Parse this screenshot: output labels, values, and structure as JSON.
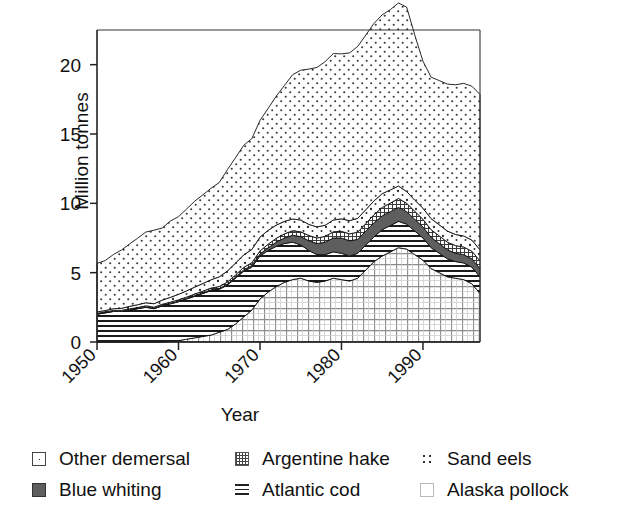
{
  "chart_data": {
    "type": "area",
    "title": "",
    "subtitle": "",
    "xlabel": "Year",
    "ylabel": "Million tonnes",
    "xlim": [
      1950,
      1997
    ],
    "ylim": [
      0,
      22.5
    ],
    "yticks": [
      0,
      5,
      10,
      15,
      20
    ],
    "xticks": [
      1950,
      1960,
      1970,
      1980,
      1990
    ],
    "xticklabels": [
      "1950",
      "1960",
      "1970",
      "1980",
      "1990"
    ],
    "yticklabels": [
      "0",
      "5",
      "10",
      "15",
      "20"
    ],
    "grid": false,
    "stacked": true,
    "legend_position": "below",
    "x": [
      1950,
      1951,
      1952,
      1953,
      1954,
      1955,
      1956,
      1957,
      1958,
      1959,
      1960,
      1961,
      1962,
      1963,
      1964,
      1965,
      1966,
      1967,
      1968,
      1969,
      1970,
      1971,
      1972,
      1973,
      1974,
      1975,
      1976,
      1977,
      1978,
      1979,
      1980,
      1981,
      1982,
      1983,
      1984,
      1985,
      1986,
      1987,
      1988,
      1989,
      1990,
      1991,
      1992,
      1993,
      1994,
      1995,
      1996,
      1997
    ],
    "series": [
      {
        "name": "Alaska pollock",
        "pattern": "grid-light",
        "values": [
          0.0,
          0.0,
          0.0,
          0.0,
          0.0,
          0.0,
          0.0,
          0.0,
          0.0,
          0.05,
          0.1,
          0.2,
          0.3,
          0.4,
          0.5,
          0.7,
          0.9,
          1.3,
          1.8,
          2.3,
          3.1,
          3.6,
          4.0,
          4.3,
          4.5,
          4.6,
          4.4,
          4.3,
          4.4,
          4.6,
          4.5,
          4.4,
          4.6,
          5.2,
          5.8,
          6.2,
          6.5,
          6.8,
          6.7,
          6.3,
          5.9,
          5.3,
          5.0,
          4.7,
          4.6,
          4.5,
          4.2,
          3.5
        ]
      },
      {
        "name": "Atlantic cod",
        "pattern": "horizontal-lines",
        "values": [
          2.0,
          2.1,
          2.2,
          2.2,
          2.3,
          2.4,
          2.5,
          2.4,
          2.6,
          2.7,
          2.8,
          2.9,
          3.0,
          3.1,
          3.2,
          3.1,
          3.2,
          3.3,
          3.3,
          3.1,
          3.1,
          3.0,
          2.9,
          2.8,
          2.7,
          2.4,
          2.2,
          2.0,
          1.9,
          1.9,
          1.9,
          1.8,
          1.8,
          1.8,
          1.8,
          1.9,
          1.9,
          1.9,
          1.8,
          1.7,
          1.6,
          1.5,
          1.4,
          1.3,
          1.2,
          1.2,
          1.2,
          1.2
        ]
      },
      {
        "name": "Blue whiting",
        "pattern": "dark-solid",
        "values": [
          0.02,
          0.02,
          0.02,
          0.02,
          0.02,
          0.02,
          0.03,
          0.03,
          0.03,
          0.03,
          0.04,
          0.04,
          0.05,
          0.05,
          0.06,
          0.06,
          0.07,
          0.08,
          0.1,
          0.12,
          0.15,
          0.2,
          0.3,
          0.4,
          0.5,
          0.6,
          0.7,
          0.8,
          0.9,
          1.0,
          1.1,
          1.1,
          1.0,
          1.0,
          1.0,
          1.0,
          1.0,
          1.0,
          0.9,
          0.85,
          0.8,
          0.75,
          0.7,
          0.65,
          0.6,
          0.6,
          0.6,
          0.6
        ]
      },
      {
        "name": "Argentine hake",
        "pattern": "checkered",
        "values": [
          0.05,
          0.05,
          0.06,
          0.06,
          0.07,
          0.07,
          0.08,
          0.08,
          0.09,
          0.09,
          0.1,
          0.1,
          0.11,
          0.12,
          0.13,
          0.14,
          0.15,
          0.16,
          0.18,
          0.2,
          0.22,
          0.25,
          0.28,
          0.3,
          0.32,
          0.35,
          0.38,
          0.4,
          0.42,
          0.45,
          0.48,
          0.5,
          0.52,
          0.55,
          0.58,
          0.6,
          0.62,
          0.65,
          0.6,
          0.58,
          0.55,
          0.55,
          0.55,
          0.55,
          0.55,
          0.55,
          0.55,
          0.55
        ]
      },
      {
        "name": "Sand eels",
        "pattern": "sparse-dots",
        "values": [
          0.1,
          0.1,
          0.12,
          0.15,
          0.18,
          0.2,
          0.22,
          0.25,
          0.3,
          0.35,
          0.4,
          0.45,
          0.5,
          0.55,
          0.6,
          0.7,
          0.8,
          0.85,
          0.9,
          0.95,
          1.0,
          1.0,
          0.95,
          0.9,
          0.85,
          0.85,
          0.8,
          0.8,
          0.8,
          0.85,
          0.9,
          0.95,
          1.0,
          1.0,
          1.0,
          1.0,
          0.95,
          0.9,
          0.85,
          0.8,
          0.8,
          0.8,
          0.8,
          0.8,
          0.8,
          0.8,
          0.8,
          0.8
        ]
      },
      {
        "name": "Other demersal",
        "pattern": "dotted",
        "values": [
          3.5,
          3.6,
          3.9,
          4.2,
          4.5,
          4.8,
          5.1,
          5.3,
          5.2,
          5.5,
          5.6,
          5.9,
          6.2,
          6.4,
          6.6,
          6.8,
          7.3,
          7.6,
          7.9,
          8.0,
          8.4,
          8.8,
          9.3,
          9.8,
          10.4,
          10.8,
          11.2,
          11.5,
          11.8,
          12.0,
          11.9,
          12.1,
          12.4,
          12.6,
          12.8,
          12.9,
          13.0,
          13.2,
          13.3,
          11.9,
          10.6,
          10.2,
          10.4,
          10.6,
          10.8,
          11.0,
          11.1,
          11.2
        ]
      }
    ],
    "totals": [
      5.67,
      5.87,
      6.3,
      6.63,
      7.07,
      7.49,
      7.93,
      8.06,
      8.22,
      8.72,
      9.04,
      9.59,
      10.16,
      10.62,
      11.09,
      11.5,
      12.42,
      13.09,
      14.18,
      14.67,
      15.97,
      16.85,
      17.73,
      18.5,
      19.27,
      19.6,
      19.68,
      19.8,
      20.22,
      20.8,
      20.78,
      20.85,
      21.32,
      22.15,
      22.98,
      23.6,
      23.97,
      24.45,
      24.15,
      22.13,
      20.25,
      19.1,
      18.85,
      18.6,
      18.55,
      18.65,
      18.45,
      17.85
    ]
  },
  "legend": {
    "items": [
      {
        "label": "Other demersal",
        "swatch": "sw-other",
        "icon": "other-demersal-swatch-icon"
      },
      {
        "label": "Argentine hake",
        "swatch": "sw-hake",
        "icon": "argentine-hake-swatch-icon"
      },
      {
        "label": "Sand eels",
        "swatch": "sw-sand",
        "icon": "sand-eels-swatch-icon"
      },
      {
        "label": "Blue whiting",
        "swatch": "sw-blue",
        "icon": "blue-whiting-swatch-icon"
      },
      {
        "label": "Atlantic cod",
        "swatch": "sw-cod",
        "icon": "atlantic-cod-swatch-icon"
      },
      {
        "label": "Alaska pollock",
        "swatch": "sw-pollock",
        "icon": "alaska-pollock-swatch-icon"
      }
    ]
  },
  "colors": {
    "axis": "#222222",
    "outline": "#111111",
    "blue_whiting_fill": "#5e5e5e",
    "background": "#ffffff"
  }
}
